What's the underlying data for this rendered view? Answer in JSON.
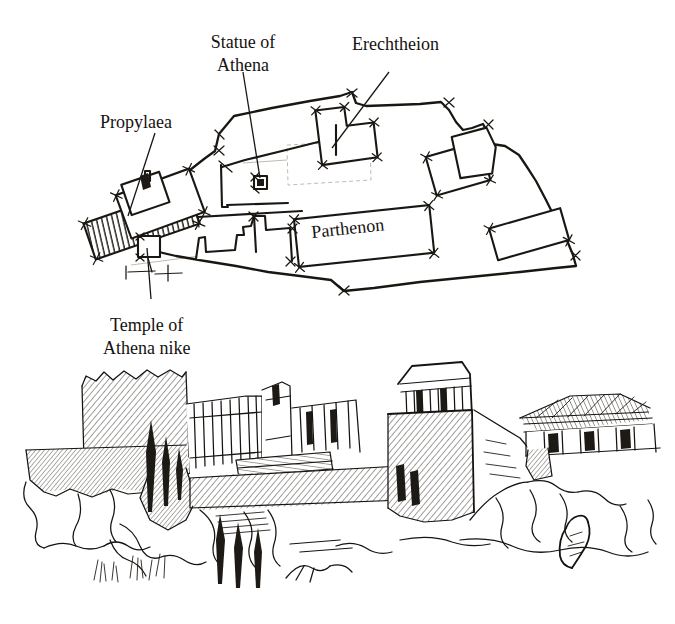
{
  "figure": {
    "background_color": "#ffffff",
    "ink_color": "#1a1713",
    "width": 675,
    "height": 624
  },
  "plan": {
    "name": "acropolis-site-plan",
    "labels": [
      {
        "id": "propylaea",
        "text": "Propylaea",
        "x": 100,
        "y": 128,
        "lines": [
          "Propylaea"
        ]
      },
      {
        "id": "statue-of-athena",
        "text": "Statue of Athena",
        "x": 200,
        "y": 46,
        "lines": [
          "Statue of",
          "Athena"
        ]
      },
      {
        "id": "erechtheion",
        "text": "Erechtheion",
        "x": 352,
        "y": 48,
        "lines": [
          "Erechtheion"
        ]
      },
      {
        "id": "temple-of-athena-nike",
        "text": "Temple of Athena nike",
        "x": 110,
        "y": 330,
        "lines": [
          "Temple of",
          "Athena nike"
        ]
      },
      {
        "id": "parthenon",
        "text": "Parthenon",
        "x": 312,
        "y": 237,
        "lines": [
          "Parthenon"
        ],
        "rotated": true,
        "rotation_deg": -6
      }
    ],
    "structures": [
      {
        "id": "propylaea-block",
        "hatch": "vertical"
      },
      {
        "id": "propylaea-wing-upper",
        "hatch": "diagonal"
      },
      {
        "id": "propylaea-wing-lower",
        "hatch": "diagonal"
      },
      {
        "id": "athena-nike-base",
        "hatch": "none"
      },
      {
        "id": "statue-of-athena-base",
        "hatch": "solid"
      },
      {
        "id": "old-temple-foundation",
        "hatch": "ghost-dashed"
      },
      {
        "id": "erechtheion-block",
        "hatch": "diagonal"
      },
      {
        "id": "east-building-a",
        "hatch": "diagonal"
      },
      {
        "id": "east-building-b",
        "hatch": "diagonal"
      },
      {
        "id": "parthenon-block",
        "hatch": "diagonal"
      },
      {
        "id": "south-wall-building",
        "hatch": "diagonal"
      },
      {
        "id": "southeast-building",
        "hatch": "diagonal"
      }
    ],
    "fortification_wall": "irregular polygon enclosing the plateau"
  },
  "elevation": {
    "name": "acropolis-elevation",
    "description": "Perspective elevation of the Acropolis seen from the west with rock cliffs, fortification walls, Parthenon and the Temple of Athena Nike at right",
    "elements": [
      {
        "id": "west-cliff-rock"
      },
      {
        "id": "fortification-wall-left"
      },
      {
        "id": "propylaea-colonnade"
      },
      {
        "id": "central-ruins"
      },
      {
        "id": "parthenon-elevation"
      },
      {
        "id": "bastion-wall"
      },
      {
        "id": "temple-of-athena-nike-elevation"
      },
      {
        "id": "rock-outcrop-right"
      },
      {
        "id": "seated-figure"
      },
      {
        "id": "cypress-trees"
      },
      {
        "id": "foreground-grass"
      }
    ]
  }
}
